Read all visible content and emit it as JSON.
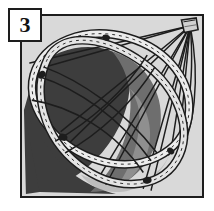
{
  "figure": {
    "step_number": "3",
    "caption": "Twisting the flexible hoop frame into a folded coil",
    "panel": {
      "background_color": "#d9d9d9",
      "border_color": "#1d1d1d"
    },
    "palette": {
      "background_light": "#d9d9d9",
      "fabric_dark": "#3d3d3d",
      "fabric_mid": "#6e6e6e",
      "fabric_midlight": "#8f8f8f",
      "ribbon_light": "#ececec",
      "ribbon_shadow": "#a8a8a8",
      "line_black": "#1d1d1d",
      "badge_white": "#ffffff"
    },
    "elements": [
      {
        "name": "apex-node",
        "label": "apex gather point",
        "x": 192,
        "y": 24
      },
      {
        "name": "upper-hoop",
        "label": "upper flexible hoop (ribbon)"
      },
      {
        "name": "lower-hoop",
        "label": "lower flexible hoop (ribbon)"
      },
      {
        "name": "dark-mesh-panel",
        "label": "dark mesh panel"
      },
      {
        "name": "support-cords",
        "label": "support cords converging at apex"
      },
      {
        "name": "stitch-marks",
        "label": "dashed stitch line along ribbon"
      }
    ]
  }
}
